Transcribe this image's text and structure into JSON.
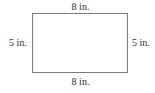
{
  "diagram": {
    "shape": "rectangle",
    "labels": {
      "top": "8 in.",
      "bottom": "8 in.",
      "left": "5 in.",
      "right": "5 in."
    },
    "colors": {
      "outline": "#7a7a7a",
      "text": "#2a2a2a"
    }
  }
}
